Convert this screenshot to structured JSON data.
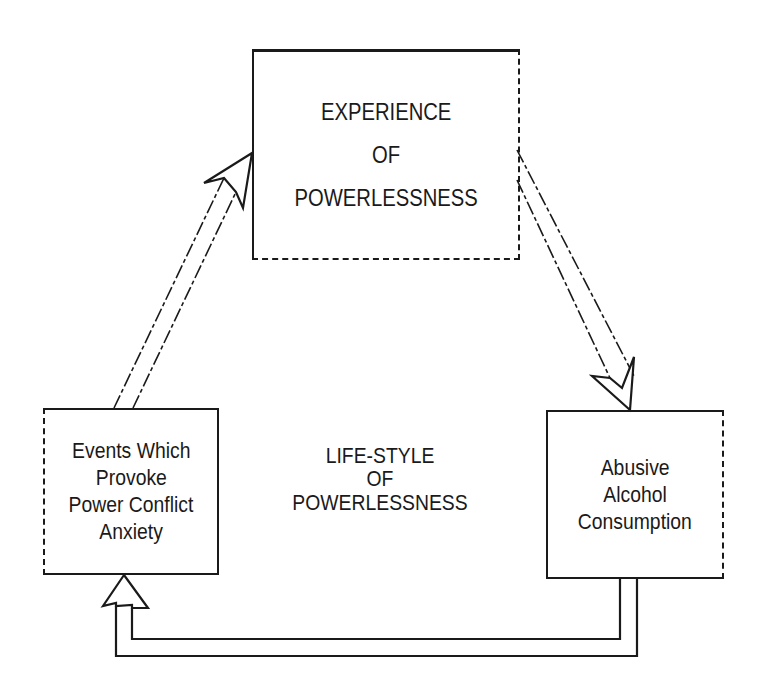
{
  "diagram": {
    "nodes": {
      "top": {
        "lines": [
          "EXPERIENCE",
          "OF",
          "POWERLESSNESS"
        ]
      },
      "left": {
        "lines": [
          "Events Which",
          "Provoke",
          "Power Conflict",
          "Anxiety"
        ]
      },
      "right": {
        "lines": [
          "Abusive",
          "Alcohol",
          "Consumption"
        ]
      }
    },
    "center_label": {
      "lines": [
        "LIFE-STYLE",
        "OF",
        "POWERLESSNESS"
      ]
    },
    "edges": [
      {
        "from": "left",
        "to": "top",
        "style": "hollow-double-arrow"
      },
      {
        "from": "top",
        "to": "right",
        "style": "hollow-double-arrow"
      },
      {
        "from": "right",
        "to": "left",
        "style": "hollow-double-arrow-routed-below"
      }
    ],
    "colors": {
      "ink": "#1a1a1a",
      "background": "#ffffff"
    }
  }
}
